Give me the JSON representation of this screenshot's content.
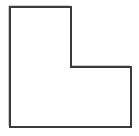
{
  "figure": {
    "name": "L-shaped polygon",
    "type": "geometric-shape-outline",
    "alt_text": "Outline drawing of an L-shaped hexagon",
    "caption": "",
    "canvas": {
      "width": 139,
      "height": 136,
      "background_color": "#ffffff"
    },
    "shape": {
      "id": "l-shape",
      "sides": 6,
      "fill_color": "#ffffff",
      "stroke_color": "#3b3b3b",
      "stroke_width": 2,
      "soft_edge_color": "#b9b9b9",
      "points": [
        [
          10,
          7
        ],
        [
          71,
          7
        ],
        [
          71,
          67
        ],
        [
          131,
          67
        ],
        [
          131,
          127
        ],
        [
          10,
          127
        ]
      ],
      "path": "M 10 7 L 71 7 L 71 67 L 131 67 L 131 127 L 10 127 Z",
      "vertex_labels": [],
      "edge_labels": [],
      "dimensions": {
        "overall_width": 121,
        "overall_height": 120,
        "upper_arm_width": 61,
        "upper_arm_height": 60,
        "lower_base_width": 121,
        "lower_base_height": 60
      }
    },
    "annotations": [],
    "labels": []
  }
}
